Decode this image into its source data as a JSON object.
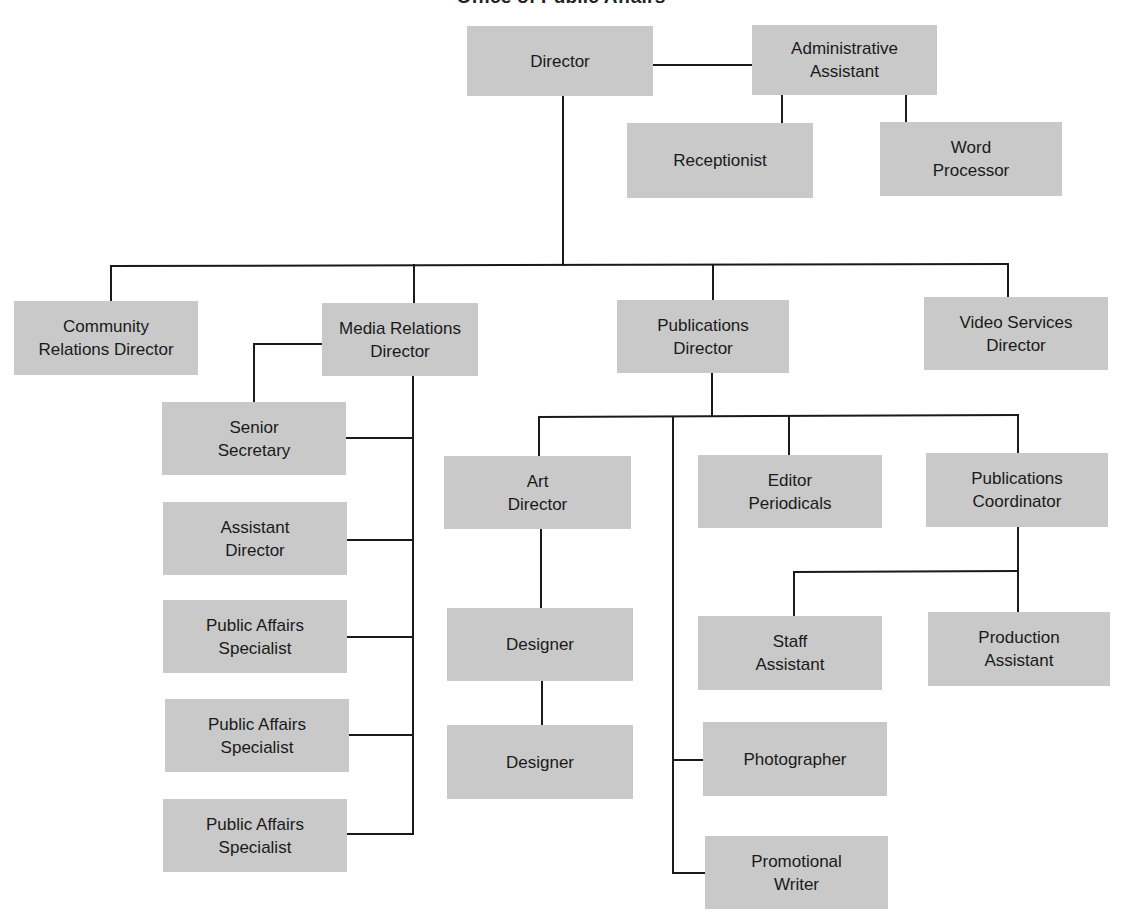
{
  "title": "Office of Public Affairs",
  "colors": {
    "box_fill": "#c9c9c9",
    "line": "#1a1a1a",
    "text": "#1a1a1a"
  },
  "nodes": [
    {
      "id": "director",
      "lines": [
        "Director"
      ],
      "x": 467,
      "y": 26,
      "w": 186,
      "h": 70
    },
    {
      "id": "admin-assistant",
      "lines": [
        "Administrative",
        "Assistant"
      ],
      "x": 752,
      "y": 25,
      "w": 185,
      "h": 70
    },
    {
      "id": "receptionist",
      "lines": [
        "Receptionist"
      ],
      "x": 627,
      "y": 123,
      "w": 186,
      "h": 75
    },
    {
      "id": "word-processor",
      "lines": [
        "Word",
        "Processor"
      ],
      "x": 880,
      "y": 122,
      "w": 182,
      "h": 74
    },
    {
      "id": "community-relations-director",
      "lines": [
        "Community",
        "Relations Director"
      ],
      "x": 14,
      "y": 301,
      "w": 184,
      "h": 74
    },
    {
      "id": "media-relations-director",
      "lines": [
        "Media Relations",
        "Director"
      ],
      "x": 322,
      "y": 303,
      "w": 156,
      "h": 73
    },
    {
      "id": "publications-director",
      "lines": [
        "Publications",
        "Director"
      ],
      "x": 617,
      "y": 300,
      "w": 172,
      "h": 73
    },
    {
      "id": "video-services-director",
      "lines": [
        "Video Services",
        "Director"
      ],
      "x": 924,
      "y": 297,
      "w": 184,
      "h": 73
    },
    {
      "id": "senior-secretary",
      "lines": [
        "Senior",
        "Secretary"
      ],
      "x": 162,
      "y": 402,
      "w": 184,
      "h": 73
    },
    {
      "id": "assistant-director",
      "lines": [
        "Assistant",
        "Director"
      ],
      "x": 163,
      "y": 502,
      "w": 184,
      "h": 73
    },
    {
      "id": "public-affairs-specialist-1",
      "lines": [
        "Public Affairs",
        "Specialist"
      ],
      "x": 163,
      "y": 600,
      "w": 184,
      "h": 73
    },
    {
      "id": "public-affairs-specialist-2",
      "lines": [
        "Public Affairs",
        "Specialist"
      ],
      "x": 165,
      "y": 699,
      "w": 184,
      "h": 73
    },
    {
      "id": "public-affairs-specialist-3",
      "lines": [
        "Public Affairs",
        "Specialist"
      ],
      "x": 163,
      "y": 799,
      "w": 184,
      "h": 73
    },
    {
      "id": "art-director",
      "lines": [
        "Art",
        "Director"
      ],
      "x": 444,
      "y": 456,
      "w": 187,
      "h": 73
    },
    {
      "id": "editor-periodicals",
      "lines": [
        "Editor",
        "Periodicals"
      ],
      "x": 698,
      "y": 455,
      "w": 184,
      "h": 73
    },
    {
      "id": "publications-coordinator",
      "lines": [
        "Publications",
        "Coordinator"
      ],
      "x": 926,
      "y": 453,
      "w": 182,
      "h": 74
    },
    {
      "id": "designer-1",
      "lines": [
        "Designer"
      ],
      "x": 447,
      "y": 608,
      "w": 186,
      "h": 73
    },
    {
      "id": "designer-2",
      "lines": [
        "Designer"
      ],
      "x": 447,
      "y": 725,
      "w": 186,
      "h": 74
    },
    {
      "id": "staff-assistant",
      "lines": [
        "Staff",
        "Assistant"
      ],
      "x": 698,
      "y": 616,
      "w": 184,
      "h": 74
    },
    {
      "id": "production-assistant",
      "lines": [
        "Production",
        "Assistant"
      ],
      "x": 928,
      "y": 612,
      "w": 182,
      "h": 74
    },
    {
      "id": "photographer",
      "lines": [
        "Photographer"
      ],
      "x": 703,
      "y": 722,
      "w": 184,
      "h": 74
    },
    {
      "id": "promotional-writer",
      "lines": [
        "Promotional",
        "Writer"
      ],
      "x": 705,
      "y": 836,
      "w": 183,
      "h": 73
    }
  ],
  "edges": [
    {
      "from": "director",
      "to": "admin-assistant",
      "points": [
        [
          653,
          65
        ],
        [
          752,
          65
        ]
      ]
    },
    {
      "from": "admin-assistant",
      "to": "receptionist",
      "points": [
        [
          782,
          95
        ],
        [
          782,
          123
        ]
      ]
    },
    {
      "from": "admin-assistant",
      "to": "word-processor",
      "points": [
        [
          906,
          95
        ],
        [
          906,
          122
        ]
      ]
    },
    {
      "from": "director",
      "to": "directors-bus",
      "points": [
        [
          563,
          96
        ],
        [
          563,
          265
        ]
      ]
    },
    {
      "from": "directors-bus",
      "to": "directors-bus",
      "points": [
        [
          111,
          266
        ],
        [
          1008,
          264
        ]
      ]
    },
    {
      "from": "directors-bus",
      "to": "community-relations-director",
      "points": [
        [
          111,
          266
        ],
        [
          111,
          301
        ]
      ]
    },
    {
      "from": "directors-bus",
      "to": "media-relations-director",
      "points": [
        [
          414,
          265
        ],
        [
          414,
          303
        ]
      ]
    },
    {
      "from": "directors-bus",
      "to": "publications-director",
      "points": [
        [
          713,
          265
        ],
        [
          713,
          300
        ]
      ]
    },
    {
      "from": "directors-bus",
      "to": "video-services-director",
      "points": [
        [
          1008,
          264
        ],
        [
          1008,
          297
        ]
      ]
    },
    {
      "from": "media-relations-director",
      "to": "senior-secretary",
      "points": [
        [
          322,
          344
        ],
        [
          254,
          344
        ],
        [
          254,
          402
        ]
      ]
    },
    {
      "from": "media-relations-director",
      "to": "media-spine",
      "points": [
        [
          413,
          376
        ],
        [
          413,
          834
        ]
      ]
    },
    {
      "from": "media-spine",
      "to": "senior-secretary",
      "points": [
        [
          346,
          438
        ],
        [
          413,
          438
        ]
      ]
    },
    {
      "from": "media-spine",
      "to": "assistant-director",
      "points": [
        [
          347,
          540
        ],
        [
          413,
          540
        ]
      ]
    },
    {
      "from": "media-spine",
      "to": "public-affairs-specialist-1",
      "points": [
        [
          347,
          637
        ],
        [
          413,
          637
        ]
      ]
    },
    {
      "from": "media-spine",
      "to": "public-affairs-specialist-2",
      "points": [
        [
          349,
          735
        ],
        [
          413,
          735
        ]
      ]
    },
    {
      "from": "media-spine",
      "to": "public-affairs-specialist-3",
      "points": [
        [
          347,
          834
        ],
        [
          413,
          834
        ]
      ]
    },
    {
      "from": "publications-director",
      "to": "publications-bus",
      "points": [
        [
          712,
          373
        ],
        [
          712,
          416
        ]
      ]
    },
    {
      "from": "publications-bus",
      "to": "publications-bus",
      "points": [
        [
          539,
          417
        ],
        [
          1018,
          415
        ]
      ]
    },
    {
      "from": "publications-bus",
      "to": "art-director",
      "points": [
        [
          539,
          417
        ],
        [
          539,
          456
        ]
      ]
    },
    {
      "from": "publications-bus",
      "to": "editor-periodicals",
      "points": [
        [
          789,
          416
        ],
        [
          789,
          455
        ]
      ]
    },
    {
      "from": "publications-bus",
      "to": "publications-coordinator",
      "points": [
        [
          1018,
          415
        ],
        [
          1018,
          453
        ]
      ]
    },
    {
      "from": "publications-bus",
      "to": "publications-spine",
      "points": [
        [
          673,
          417
        ],
        [
          673,
          873
        ]
      ]
    },
    {
      "from": "publications-spine",
      "to": "photographer",
      "points": [
        [
          673,
          760
        ],
        [
          703,
          760
        ]
      ]
    },
    {
      "from": "publications-spine",
      "to": "promotional-writer",
      "points": [
        [
          673,
          873
        ],
        [
          705,
          873
        ]
      ]
    },
    {
      "from": "art-director",
      "to": "designer-1",
      "points": [
        [
          541,
          529
        ],
        [
          541,
          608
        ]
      ]
    },
    {
      "from": "designer-1",
      "to": "designer-2",
      "points": [
        [
          542,
          681
        ],
        [
          542,
          725
        ]
      ]
    },
    {
      "from": "publications-coordinator",
      "to": "production-assistant",
      "points": [
        [
          1018,
          527
        ],
        [
          1018,
          612
        ]
      ]
    },
    {
      "from": "publications-coordinator",
      "to": "staff-assistant",
      "points": [
        [
          1018,
          571
        ],
        [
          794,
          572
        ],
        [
          794,
          616
        ]
      ]
    }
  ]
}
